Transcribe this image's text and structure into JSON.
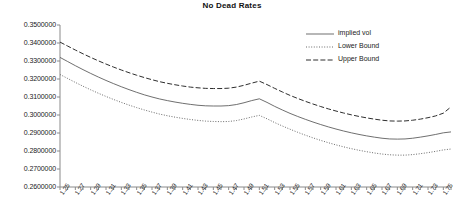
{
  "chart_data": {
    "type": "line",
    "title": "No Dead Rates",
    "xlabel": "",
    "ylabel": "",
    "grid": false,
    "legend_position": "top-right",
    "xlim": [
      1.25,
      1.76
    ],
    "ylim": [
      0.26,
      0.35
    ],
    "ytick_labels": [
      "0.3500000",
      "0.3400000",
      "0.3300000",
      "0.3200000",
      "0.3100000",
      "0.3000000",
      "0.2900000",
      "0.2800000",
      "0.2700000",
      "0.2600000"
    ],
    "ytick_values": [
      0.35,
      0.34,
      0.33,
      0.32,
      0.31,
      0.3,
      0.29,
      0.28,
      0.27,
      0.26
    ],
    "xtick_labels": [
      "1.25",
      "1.27",
      "1.29",
      "1.31",
      "1.33",
      "1.35",
      "1.37",
      "1.39",
      "1.41",
      "1.43",
      "1.45",
      "1.47",
      "1.49",
      "1.51",
      "1.53",
      "1.55",
      "1.57",
      "1.59",
      "1.61",
      "1.63",
      "1.65",
      "1.67",
      "1.69",
      "1.71",
      "1.73",
      "1.75"
    ],
    "xtick_values": [
      1.25,
      1.27,
      1.29,
      1.31,
      1.33,
      1.35,
      1.37,
      1.39,
      1.41,
      1.43,
      1.45,
      1.47,
      1.49,
      1.51,
      1.53,
      1.55,
      1.57,
      1.59,
      1.61,
      1.63,
      1.65,
      1.67,
      1.69,
      1.71,
      1.73,
      1.75
    ],
    "minor_tick_step": 0.01,
    "x": [
      1.25,
      1.26,
      1.27,
      1.28,
      1.29,
      1.3,
      1.31,
      1.32,
      1.33,
      1.34,
      1.35,
      1.36,
      1.37,
      1.38,
      1.39,
      1.4,
      1.41,
      1.42,
      1.43,
      1.44,
      1.45,
      1.46,
      1.47,
      1.48,
      1.49,
      1.5,
      1.51,
      1.52,
      1.53,
      1.54,
      1.55,
      1.56,
      1.57,
      1.58,
      1.59,
      1.6,
      1.61,
      1.62,
      1.63,
      1.64,
      1.65,
      1.66,
      1.67,
      1.68,
      1.69,
      1.7,
      1.71,
      1.72,
      1.73,
      1.74,
      1.75,
      1.76
    ],
    "series": [
      {
        "name": "implied vol",
        "style": "solid",
        "color": "#555555",
        "values": [
          0.332,
          0.3297,
          0.3274,
          0.3252,
          0.3231,
          0.3211,
          0.3192,
          0.3174,
          0.3157,
          0.3141,
          0.3126,
          0.3112,
          0.31,
          0.3089,
          0.308,
          0.3072,
          0.3065,
          0.3059,
          0.3054,
          0.3051,
          0.305,
          0.305,
          0.3052,
          0.3058,
          0.3068,
          0.308,
          0.309,
          0.307,
          0.3048,
          0.3028,
          0.3009,
          0.2992,
          0.2976,
          0.2961,
          0.2947,
          0.2934,
          0.2922,
          0.2911,
          0.2901,
          0.2892,
          0.2884,
          0.2877,
          0.2871,
          0.2867,
          0.2866,
          0.2867,
          0.2871,
          0.2877,
          0.2884,
          0.2892,
          0.2901,
          0.2906
        ]
      },
      {
        "name": "Lower Bound",
        "style": "dotted",
        "color": "#6b6b6b",
        "values": [
          0.3225,
          0.3203,
          0.3181,
          0.316,
          0.314,
          0.3121,
          0.3103,
          0.3086,
          0.307,
          0.3055,
          0.3041,
          0.3028,
          0.3016,
          0.3005,
          0.2996,
          0.2988,
          0.2981,
          0.2975,
          0.297,
          0.2966,
          0.2964,
          0.2963,
          0.2964,
          0.2969,
          0.2978,
          0.2989,
          0.2998,
          0.2979,
          0.2958,
          0.2939,
          0.2921,
          0.2904,
          0.2888,
          0.2873,
          0.2859,
          0.2846,
          0.2834,
          0.2823,
          0.2813,
          0.2804,
          0.2796,
          0.2789,
          0.2783,
          0.2779,
          0.2777,
          0.2777,
          0.278,
          0.2785,
          0.2791,
          0.2798,
          0.2806,
          0.2811
        ]
      },
      {
        "name": "Upper Bound",
        "style": "dashed",
        "color": "#2e2e2e",
        "values": [
          0.3405,
          0.3383,
          0.3361,
          0.334,
          0.332,
          0.3301,
          0.3283,
          0.3266,
          0.325,
          0.3235,
          0.3221,
          0.3208,
          0.3196,
          0.3185,
          0.3176,
          0.3168,
          0.3161,
          0.3155,
          0.3151,
          0.3148,
          0.3147,
          0.3147,
          0.3149,
          0.3155,
          0.3165,
          0.3177,
          0.3188,
          0.3169,
          0.3148,
          0.3128,
          0.3109,
          0.3092,
          0.3076,
          0.3061,
          0.3047,
          0.3034,
          0.3022,
          0.3011,
          0.3001,
          0.2992,
          0.2984,
          0.2977,
          0.2971,
          0.2967,
          0.2966,
          0.2967,
          0.2971,
          0.2977,
          0.2985,
          0.2995,
          0.301,
          0.3045
        ]
      }
    ],
    "legend_entries": [
      {
        "label": "implied vol",
        "style": "solid"
      },
      {
        "label": "Lower Bound",
        "style": "dotted"
      },
      {
        "label": "Upper Bound",
        "style": "dashed"
      }
    ]
  }
}
